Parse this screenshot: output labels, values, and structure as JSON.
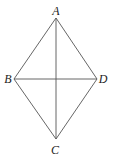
{
  "diagram": {
    "type": "rhombus-with-diagonals",
    "vertices": {
      "A": {
        "label": "A",
        "x": 56,
        "y": 18,
        "lx": 56,
        "ly": 15
      },
      "B": {
        "label": "B",
        "x": 14,
        "y": 79,
        "lx": 8,
        "ly": 83
      },
      "C": {
        "label": "C",
        "x": 56,
        "y": 139,
        "lx": 55,
        "ly": 154
      },
      "D": {
        "label": "D",
        "x": 97,
        "y": 79,
        "lx": 103,
        "ly": 83
      }
    },
    "edges": [
      [
        "A",
        "B"
      ],
      [
        "B",
        "C"
      ],
      [
        "C",
        "D"
      ],
      [
        "D",
        "A"
      ]
    ],
    "diagonals": [
      [
        "A",
        "C"
      ],
      [
        "B",
        "D"
      ]
    ]
  }
}
